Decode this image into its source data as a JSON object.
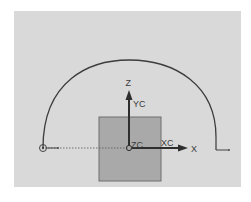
{
  "viewport": {
    "background": "#d9d9d9"
  },
  "sketch": {
    "arc": {
      "color": "#3c3c3c",
      "left_end": [
        43,
        148
      ],
      "right_end": [
        216,
        137
      ],
      "apex_y": 60
    },
    "block": {
      "fill": "#a9a9a9",
      "stroke": "#6e6e6e"
    },
    "reference_line": {
      "style": "dotted",
      "color": "#555555"
    }
  },
  "axes": {
    "z_label": "Z",
    "yc_label": "YC",
    "zc_label": "ZC",
    "xc_label": "XC",
    "x_label": "X"
  },
  "icons": {
    "start_point": "circle-point-icon",
    "end_point": "l-marker-icon",
    "origin": "origin-icon"
  }
}
